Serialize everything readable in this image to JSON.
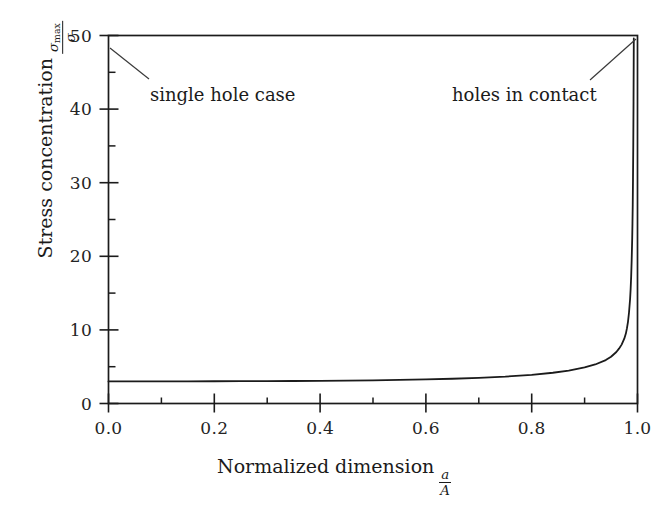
{
  "figure": {
    "width": 669,
    "height": 514,
    "background": "#ffffff",
    "ink_color": "#1b1b1b"
  },
  "axes": {
    "x_label_text": "Normalized dimension",
    "x_label_fraction": {
      "numerator": "a",
      "denominator": "A"
    },
    "y_label_text": "Stress concentration",
    "y_label_fraction": {
      "numerator": "σ",
      "numerator_subscript": "max",
      "denominator": "σ"
    },
    "x_tick_labels": [
      "0.0",
      "0.2",
      "0.4",
      "0.6",
      "0.8",
      "1.0"
    ],
    "y_tick_labels": [
      "0",
      "10",
      "20",
      "30",
      "40",
      "50"
    ]
  },
  "annotations": [
    {
      "id": "single-hole",
      "text": "single hole case"
    },
    {
      "id": "holes-contact",
      "text": "holes in contact"
    }
  ],
  "chart_data": {
    "type": "line",
    "title": "",
    "xlabel": "Normalized dimension a/A",
    "ylabel": "Stress concentration sigma_max/sigma",
    "xlim": [
      0.0,
      1.0
    ],
    "ylim": [
      0,
      50
    ],
    "xticks": [
      0.0,
      0.2,
      0.4,
      0.6,
      0.8,
      1.0
    ],
    "yticks": [
      0,
      10,
      20,
      30,
      40,
      50
    ],
    "x_minor_ticks": [
      0.1,
      0.3,
      0.5,
      0.7,
      0.9
    ],
    "y_minor_ticks": [
      5,
      15,
      25,
      35,
      45
    ],
    "grid": false,
    "legend": null,
    "series": [
      {
        "name": "stress concentration factor",
        "x": [
          0.0,
          0.05,
          0.1,
          0.15,
          0.2,
          0.25,
          0.3,
          0.35,
          0.4,
          0.45,
          0.5,
          0.55,
          0.6,
          0.65,
          0.7,
          0.75,
          0.8,
          0.84,
          0.87,
          0.9,
          0.92,
          0.94,
          0.95,
          0.96,
          0.965,
          0.97,
          0.975,
          0.978,
          0.98,
          0.982,
          0.984,
          0.986,
          0.987,
          0.988,
          0.989,
          0.99,
          0.9905,
          0.991,
          0.9915,
          0.992,
          0.9925,
          0.993
        ],
        "y": [
          3.0,
          3.0,
          3.01,
          3.01,
          3.02,
          3.03,
          3.04,
          3.06,
          3.08,
          3.11,
          3.15,
          3.2,
          3.27,
          3.36,
          3.48,
          3.65,
          3.9,
          4.18,
          4.47,
          4.9,
          5.3,
          5.9,
          6.35,
          7.0,
          7.45,
          8.0,
          8.8,
          9.5,
          10.2,
          11.1,
          12.4,
          14.2,
          15.5,
          17.2,
          19.5,
          22.5,
          24.5,
          27.0,
          30.5,
          35.0,
          41.0,
          49.6
        ]
      }
    ],
    "annotations": [
      {
        "text": "single hole case",
        "points_to_x": 0.0,
        "points_to_y": 48.2
      },
      {
        "text": "holes in contact",
        "points_to_x": 1.0,
        "points_to_y": 48.5
      }
    ]
  }
}
